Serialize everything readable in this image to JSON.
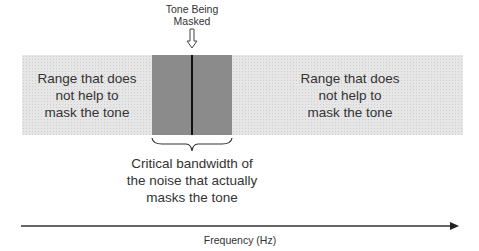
{
  "diagram": {
    "tone_label": "Tone Being Masked",
    "tone_label_lines": [
      "Tone Being",
      "Masked"
    ],
    "left_range": {
      "lines": [
        "Range that does",
        "not help to",
        "mask the tone"
      ]
    },
    "right_range": {
      "lines": [
        "Range that does",
        "not help to",
        "mask the tone"
      ]
    },
    "critical_band": {
      "lines": [
        "Critical bandwidth of",
        "the noise that actually",
        "masks the tone"
      ]
    },
    "axis_label": "Frequency (Hz)",
    "icons": {
      "tone_arrow": "down-arrow-outline-icon",
      "brace": "curly-brace-icon",
      "axis_arrow": "right-arrowhead-icon"
    },
    "colors": {
      "outer_band": "#e6e6e6",
      "critical_band": "#a9a9a9",
      "tone_line": "#111111",
      "text": "#333333"
    }
  }
}
